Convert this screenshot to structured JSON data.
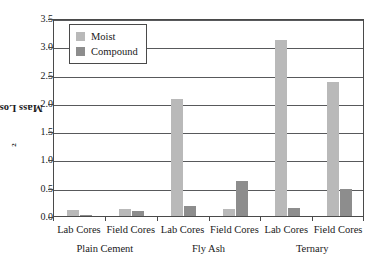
{
  "chart_data": {
    "type": "bar",
    "title": "",
    "subtitle": "",
    "xlabel": "",
    "ylabel": "Mass Loss, kg/m",
    "ylabel_superscript": "2",
    "ylim": [
      0.0,
      3.5
    ],
    "ytick_labels": [
      "0.0",
      "0.5",
      "1.0",
      "1.5",
      "2.0",
      "2.5",
      "3.0",
      "3.5"
    ],
    "ytick_values": [
      0.0,
      0.5,
      1.0,
      1.5,
      2.0,
      2.5,
      3.0,
      3.5
    ],
    "grid": "horizontal",
    "legend_position": "upper-left-inset",
    "categories": [
      "Lab Cores",
      "Field Cores",
      "Lab Cores",
      "Field Cores",
      "Lab Cores",
      "Field Cores"
    ],
    "groups": [
      {
        "label": "Plain Cement",
        "categories": [
          "Lab Cores",
          "Field Cores"
        ]
      },
      {
        "label": "Fly Ash",
        "categories": [
          "Lab Cores",
          "Field Cores"
        ]
      },
      {
        "label": "Ternary",
        "categories": [
          "Lab Cores",
          "Field Cores"
        ]
      }
    ],
    "series": [
      {
        "name": "Moist",
        "color": "#b9b9b9",
        "values": [
          0.11,
          0.13,
          2.07,
          0.13,
          3.11,
          2.37
        ]
      },
      {
        "name": "Compound",
        "color": "#8d8d8d",
        "values": [
          0.02,
          0.09,
          0.18,
          0.62,
          0.14,
          0.48
        ]
      }
    ]
  },
  "legend": {
    "items": [
      {
        "label": "Moist",
        "color": "#b9b9b9"
      },
      {
        "label": "Compound",
        "color": "#8d8d8d"
      }
    ]
  },
  "colors": {
    "moist": "#b9b9b9",
    "compound": "#8d8d8d",
    "axis": "#4a4a4a",
    "grid": "#58595b",
    "background": "#ffffff"
  }
}
